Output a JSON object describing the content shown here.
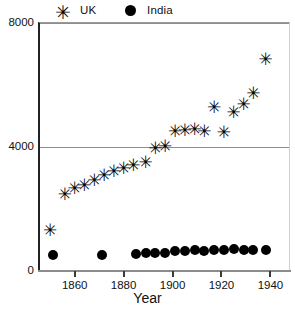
{
  "legend": {
    "items": [
      {
        "label": "UK",
        "marker": "asterisk-icon",
        "glyph": "✳",
        "color": "#000000"
      },
      {
        "label": "India",
        "marker": "filled-circle-icon",
        "glyph": "●",
        "color": "#000000"
      }
    ]
  },
  "axes": {
    "x": {
      "title": "Year",
      "ticks": [
        1860,
        1880,
        1900,
        1920,
        1940
      ],
      "tick_labels": [
        "1860",
        "1880",
        "1900",
        "1920",
        "1940"
      ],
      "range": [
        1845,
        1948
      ]
    },
    "y": {
      "title": "",
      "ticks": [
        0,
        4000,
        8000
      ],
      "tick_labels": [
        "0",
        "4000",
        "8000"
      ],
      "range": [
        0,
        8000
      ]
    },
    "gridlines": [
      "0",
      "4000",
      "8000"
    ]
  },
  "chart_data": {
    "type": "scatter",
    "title": "",
    "xlabel": "Year",
    "ylabel": "",
    "xlim": [
      1845,
      1948
    ],
    "ylim": [
      0,
      8000
    ],
    "grid": true,
    "legend_position": "top",
    "series": [
      {
        "name": "UK",
        "marker": "asterisk",
        "color": "#000000",
        "points": [
          {
            "x": 1850,
            "y": 1300
          },
          {
            "x": 1856,
            "y": 2450
          },
          {
            "x": 1860,
            "y": 2650
          },
          {
            "x": 1864,
            "y": 2750
          },
          {
            "x": 1868,
            "y": 2900
          },
          {
            "x": 1872,
            "y": 3050
          },
          {
            "x": 1876,
            "y": 3200
          },
          {
            "x": 1880,
            "y": 3300
          },
          {
            "x": 1884,
            "y": 3400
          },
          {
            "x": 1889,
            "y": 3500
          },
          {
            "x": 1893,
            "y": 3950
          },
          {
            "x": 1897,
            "y": 4000
          },
          {
            "x": 1901,
            "y": 4500
          },
          {
            "x": 1905,
            "y": 4520
          },
          {
            "x": 1909,
            "y": 4560
          },
          {
            "x": 1913,
            "y": 4500
          },
          {
            "x": 1917,
            "y": 5250
          },
          {
            "x": 1921,
            "y": 4450
          },
          {
            "x": 1925,
            "y": 5100
          },
          {
            "x": 1929,
            "y": 5350
          },
          {
            "x": 1933,
            "y": 5700
          },
          {
            "x": 1938,
            "y": 6800
          }
        ]
      },
      {
        "name": "India",
        "marker": "circle",
        "color": "#000000",
        "points": [
          {
            "x": 1851,
            "y": 470
          },
          {
            "x": 1871,
            "y": 470
          },
          {
            "x": 1885,
            "y": 520
          },
          {
            "x": 1889,
            "y": 540
          },
          {
            "x": 1893,
            "y": 540
          },
          {
            "x": 1897,
            "y": 560
          },
          {
            "x": 1901,
            "y": 600
          },
          {
            "x": 1905,
            "y": 620
          },
          {
            "x": 1909,
            "y": 640
          },
          {
            "x": 1913,
            "y": 620
          },
          {
            "x": 1917,
            "y": 640
          },
          {
            "x": 1921,
            "y": 650
          },
          {
            "x": 1925,
            "y": 680
          },
          {
            "x": 1929,
            "y": 660
          },
          {
            "x": 1933,
            "y": 650
          },
          {
            "x": 1938,
            "y": 660
          }
        ]
      }
    ]
  }
}
